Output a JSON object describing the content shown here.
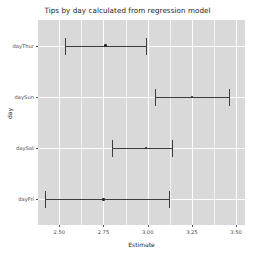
{
  "chart_data": {
    "type": "scatter",
    "title": "Tips by day calculated from regression model",
    "xlabel": "Estimate",
    "ylabel": "day",
    "xlim": [
      2.38,
      3.55
    ],
    "ylim": [
      0,
      5
    ],
    "grid": true,
    "legend": null,
    "xticks": [
      "2.50",
      "2.75",
      "3.00",
      "3.25",
      "3.50"
    ],
    "xtick_values": [
      2.5,
      2.75,
      3.0,
      3.25,
      3.5
    ],
    "categories": [
      "dayThur",
      "daySun",
      "daySat",
      "dayFri"
    ],
    "values": [
      2.76,
      3.25,
      2.99,
      2.75
    ],
    "series": [
      {
        "name": "estimate",
        "points": [
          {
            "category": "dayThur",
            "estimate": 2.76,
            "ci_low": 2.53,
            "ci_high": 2.99
          },
          {
            "category": "daySun",
            "estimate": 3.25,
            "ci_low": 3.04,
            "ci_high": 3.46
          },
          {
            "category": "daySat",
            "estimate": 2.99,
            "ci_low": 2.8,
            "ci_high": 3.14
          },
          {
            "category": "dayFri",
            "estimate": 2.75,
            "ci_low": 2.42,
            "ci_high": 3.12
          }
        ]
      }
    ],
    "panel_color": "#d9d9d9",
    "gridline_color": "#ffffff",
    "marker_color": "#262626"
  }
}
